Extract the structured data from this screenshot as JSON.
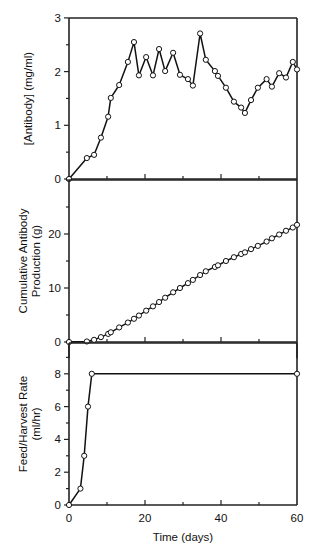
{
  "chart_data": [
    {
      "type": "line",
      "panel": "top",
      "title": "",
      "xlabel": "",
      "ylabel": "[Antibody] (mg/ml)",
      "xlim": [
        0,
        60
      ],
      "ylim": [
        0,
        3
      ],
      "yticks": [
        0,
        1,
        2,
        3
      ],
      "ytick_labels": [
        "0",
        "1",
        "2",
        "3"
      ],
      "grid": false,
      "markers": "open-circle",
      "x": [
        0,
        4.7,
        6.6,
        8.4,
        10.3,
        11.0,
        13.2,
        15.5,
        17.1,
        18.4,
        20.3,
        22.1,
        23.7,
        25.3,
        27.4,
        29.2,
        31.3,
        32.6,
        34.5,
        36.0,
        38.4,
        39.2,
        41.3,
        43.4,
        45.3,
        46.3,
        47.9,
        49.7,
        52.0,
        53.4,
        55.3,
        57.1,
        58.9,
        60.0
      ],
      "values": [
        0,
        0.39,
        0.45,
        0.77,
        1.16,
        1.51,
        1.75,
        2.18,
        2.55,
        1.93,
        2.27,
        1.93,
        2.42,
        2.01,
        2.35,
        1.94,
        1.86,
        1.74,
        2.71,
        2.22,
        2.01,
        1.92,
        1.7,
        1.44,
        1.33,
        1.23,
        1.47,
        1.7,
        1.86,
        1.72,
        1.97,
        1.89,
        2.18,
        2.04
      ]
    },
    {
      "type": "line",
      "panel": "middle",
      "title": "",
      "xlabel": "",
      "ylabel": "Cumulative Antibody Production (g)",
      "ylabel_lines": [
        "Cumulative Antibody",
        "Production (g)"
      ],
      "xlim": [
        0,
        60
      ],
      "ylim": [
        -3,
        30
      ],
      "yticks": [
        0,
        10,
        20
      ],
      "ytick_labels": [
        "0",
        "10",
        "20"
      ],
      "grid": false,
      "markers": "open-circle",
      "x": [
        0,
        4.7,
        6.6,
        8.4,
        10.3,
        11.0,
        13.2,
        15.5,
        17.1,
        18.4,
        20.3,
        22.1,
        23.7,
        25.3,
        27.4,
        29.2,
        31.3,
        32.6,
        34.5,
        36.0,
        38.4,
        39.2,
        41.3,
        43.4,
        45.3,
        46.3,
        47.9,
        49.7,
        52.0,
        53.4,
        55.3,
        57.1,
        58.9,
        60.0
      ],
      "values": [
        0,
        0.1,
        0.4,
        0.9,
        1.5,
        1.8,
        2.7,
        3.6,
        4.3,
        4.9,
        5.8,
        6.6,
        7.4,
        8.2,
        9.2,
        10.0,
        10.9,
        11.5,
        12.4,
        13.1,
        13.9,
        14.2,
        15.0,
        15.7,
        16.3,
        16.6,
        17.2,
        17.8,
        18.6,
        19.2,
        19.9,
        20.6,
        21.2,
        21.7
      ]
    },
    {
      "type": "line",
      "panel": "bottom",
      "title": "",
      "xlabel": "Time (days)",
      "ylabel": "Feed/Harvest Rate (ml/hr)",
      "ylabel_lines": [
        "Feed/Harvest Rate",
        "(ml/hr)"
      ],
      "xlim": [
        0,
        60
      ],
      "ylim": [
        0,
        10
      ],
      "xticks": [
        0,
        20,
        40,
        60
      ],
      "xtick_labels": [
        "0",
        "20",
        "40",
        "60"
      ],
      "yticks": [
        0,
        2,
        4,
        6,
        8
      ],
      "ytick_labels": [
        "0",
        "2",
        "4",
        "6",
        "8"
      ],
      "grid": false,
      "markers": "open-circle",
      "x": [
        0,
        3,
        4,
        5,
        6,
        60
      ],
      "values": [
        0,
        1,
        3,
        6,
        8,
        8
      ]
    }
  ]
}
